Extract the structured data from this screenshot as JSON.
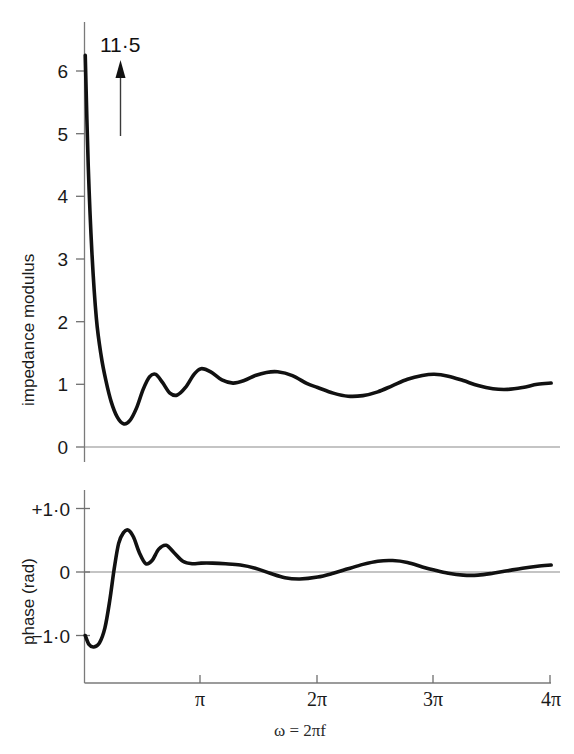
{
  "figure": {
    "annotation": {
      "label": "11·5",
      "icon": "up-arrow-icon"
    },
    "upper": {
      "ylabel": "impedance modulus",
      "yticks": [
        "0",
        "1",
        "2",
        "3",
        "4",
        "5",
        "6"
      ]
    },
    "lower": {
      "ylabel": "phase (rad)",
      "yticks": [
        "+1·0",
        "0",
        "−1·0"
      ]
    },
    "xaxis": {
      "label": "ω = 2πf",
      "ticks": [
        "π",
        "2π",
        "3π",
        "4π"
      ]
    }
  },
  "chart_data": [
    {
      "type": "line",
      "title": "impedance modulus vs angular frequency",
      "xlabel": "ω = 2πf",
      "ylabel": "impedance modulus",
      "xlim": [
        0,
        12.566
      ],
      "ylim": [
        0,
        6.3
      ],
      "xtick_values": [
        3.1416,
        6.2832,
        9.4248,
        12.5664
      ],
      "xtick_labels": [
        "π",
        "2π",
        "3π",
        "4π"
      ],
      "ytick_values": [
        0,
        1,
        2,
        3,
        4,
        5,
        6
      ],
      "ytick_labels": [
        "0",
        "1",
        "2",
        "3",
        "4",
        "5",
        "6"
      ],
      "grid": false,
      "legend": "none",
      "annotations": [
        {
          "text": "11·5",
          "x": 0.6,
          "y": 6.6,
          "arrow": "up",
          "note": "off-scale peak value of impedance modulus at origin"
        }
      ],
      "x": [
        0.02,
        0.1,
        0.2,
        0.32,
        0.45,
        0.58,
        0.72,
        0.88,
        1.05,
        1.22,
        1.4,
        1.58,
        1.75,
        1.92,
        2.1,
        2.3,
        2.5,
        2.72,
        2.95,
        3.14,
        3.4,
        3.7,
        4.0,
        4.3,
        4.6,
        4.9,
        5.2,
        5.6,
        6.0,
        6.28,
        6.7,
        7.1,
        7.5,
        7.9,
        8.3,
        8.7,
        9.1,
        9.42,
        9.8,
        10.2,
        10.6,
        11.0,
        11.4,
        11.8,
        12.2,
        12.57
      ],
      "y": [
        6.25,
        4.5,
        3.1,
        2.05,
        1.45,
        1.05,
        0.72,
        0.48,
        0.37,
        0.42,
        0.62,
        0.92,
        1.12,
        1.16,
        1.03,
        0.86,
        0.83,
        0.95,
        1.16,
        1.25,
        1.2,
        1.07,
        1.02,
        1.06,
        1.14,
        1.19,
        1.2,
        1.14,
        1.01,
        0.95,
        0.86,
        0.81,
        0.82,
        0.88,
        0.98,
        1.08,
        1.14,
        1.16,
        1.13,
        1.06,
        0.98,
        0.93,
        0.92,
        0.95,
        1.0,
        1.02
      ]
    },
    {
      "type": "line",
      "title": "phase vs angular frequency",
      "xlabel": "ω = 2πf",
      "ylabel": "phase (rad)",
      "xlim": [
        0,
        12.566
      ],
      "ylim": [
        -1.45,
        1.25
      ],
      "xtick_values": [
        3.1416,
        6.2832,
        9.4248,
        12.5664
      ],
      "xtick_labels": [
        "π",
        "2π",
        "3π",
        "4π"
      ],
      "ytick_values": [
        1.0,
        0.0,
        -1.0
      ],
      "ytick_labels": [
        "+1·0",
        "0",
        "−1·0"
      ],
      "grid": false,
      "legend": "none",
      "x": [
        0.02,
        0.12,
        0.25,
        0.4,
        0.55,
        0.68,
        0.8,
        0.92,
        1.05,
        1.18,
        1.32,
        1.48,
        1.65,
        1.82,
        2.0,
        2.2,
        2.42,
        2.65,
        2.9,
        3.14,
        3.45,
        3.8,
        4.2,
        4.6,
        5.0,
        5.4,
        5.8,
        6.28,
        6.7,
        7.1,
        7.5,
        7.9,
        8.3,
        8.7,
        9.1,
        9.42,
        9.8,
        10.2,
        10.6,
        11.0,
        11.4,
        11.8,
        12.2,
        12.57
      ],
      "y": [
        -1.0,
        -1.14,
        -1.18,
        -1.12,
        -0.88,
        -0.45,
        0.05,
        0.45,
        0.62,
        0.66,
        0.55,
        0.3,
        0.13,
        0.18,
        0.36,
        0.42,
        0.3,
        0.17,
        0.13,
        0.14,
        0.14,
        0.13,
        0.11,
        0.06,
        -0.02,
        -0.09,
        -0.11,
        -0.08,
        -0.02,
        0.05,
        0.12,
        0.17,
        0.18,
        0.15,
        0.08,
        0.03,
        -0.02,
        -0.05,
        -0.05,
        -0.02,
        0.02,
        0.06,
        0.09,
        0.11
      ]
    }
  ]
}
